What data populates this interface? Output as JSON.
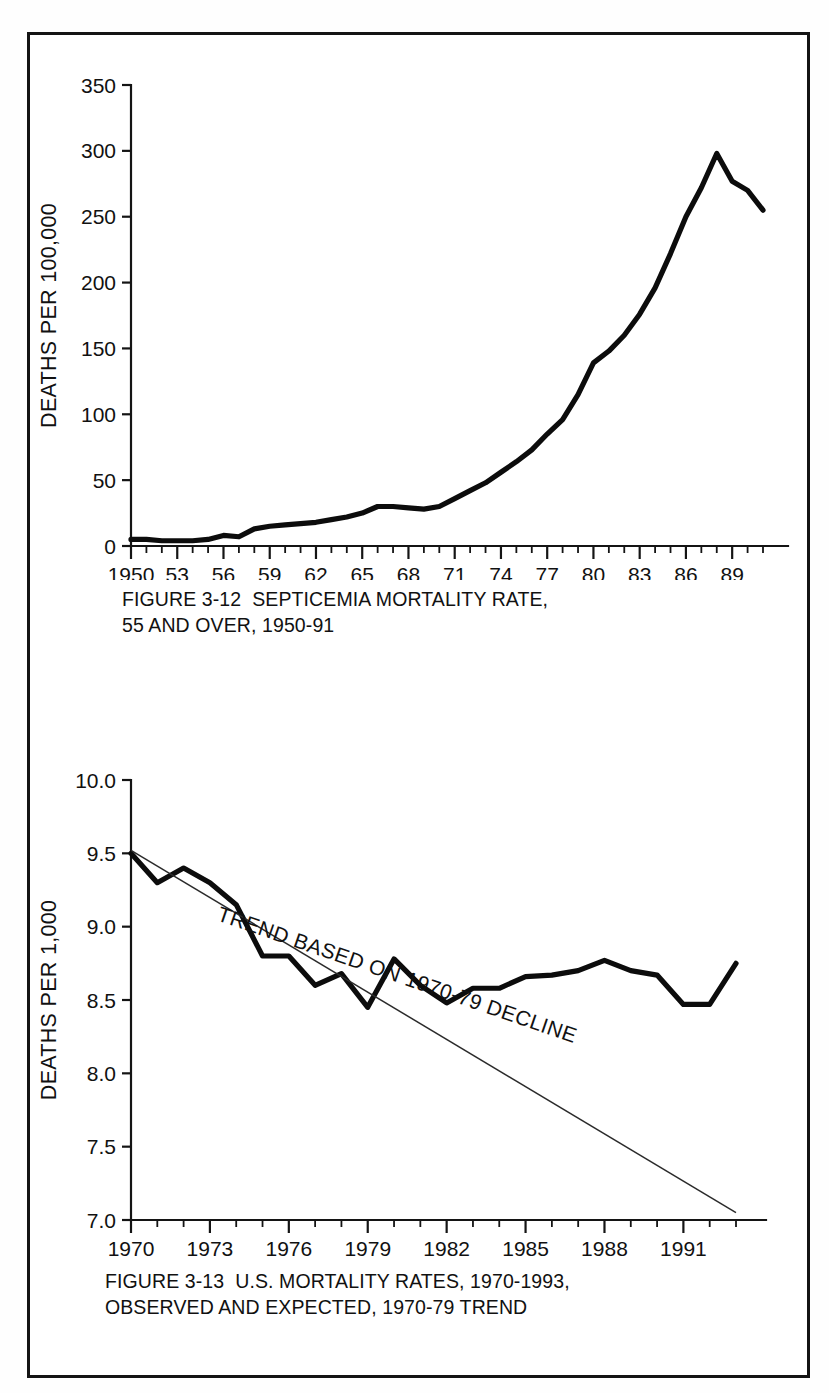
{
  "page": {
    "background": "#fefefe",
    "frame_color": "#141414"
  },
  "figures": [
    {
      "id": "figure-3-12",
      "caption_line_1": "FIGURE 3-12  SEPTICEMIA MORTALITY RATE,",
      "caption_line_2": "55 AND OVER, 1950-91",
      "ylabel": "DEATHS PER 100,000"
    },
    {
      "id": "figure-3-13",
      "caption_line_1": "FIGURE 3-13  U.S. MORTALITY RATES, 1970-1993,",
      "caption_line_2": "OBSERVED AND EXPECTED, 1970-79 TREND",
      "ylabel": "DEATHS PER 1,000",
      "annotation": "TREND BASED ON 1970-79 DECLINE"
    }
  ],
  "chart_data": [
    {
      "type": "line",
      "title": "FIGURE 3-12  SEPTICEMIA MORTALITY RATE, 55 AND OVER, 1950-91",
      "xlabel": "",
      "ylabel": "DEATHS PER 100,000",
      "xlim": [
        1950,
        1991
      ],
      "ylim": [
        0,
        350
      ],
      "yticks": [
        0,
        50,
        100,
        150,
        200,
        250,
        300,
        350
      ],
      "ytick_labels": [
        "0",
        "50",
        "100",
        "150",
        "200",
        "250",
        "300",
        "350"
      ],
      "xticks": [
        1950,
        1953,
        1956,
        1959,
        1962,
        1965,
        1968,
        1971,
        1974,
        1977,
        1980,
        1983,
        1986,
        1989
      ],
      "xtick_labels": [
        "1950",
        "53",
        "56",
        "59",
        "62",
        "65",
        "68",
        "71",
        "74",
        "77",
        "80",
        "83",
        "86",
        "89"
      ],
      "minor_xtick_interval": 1,
      "grid": false,
      "legend": null,
      "series": [
        {
          "name": "Septicemia mortality rate, 55 and over",
          "x": [
            1950,
            1951,
            1952,
            1953,
            1954,
            1955,
            1956,
            1957,
            1958,
            1959,
            1960,
            1961,
            1962,
            1963,
            1964,
            1965,
            1966,
            1967,
            1968,
            1969,
            1970,
            1971,
            1972,
            1973,
            1974,
            1975,
            1976,
            1977,
            1978,
            1979,
            1980,
            1981,
            1982,
            1983,
            1984,
            1985,
            1986,
            1987,
            1988,
            1989,
            1990,
            1991
          ],
          "values": [
            5,
            5,
            4,
            4,
            4,
            5,
            8,
            7,
            13,
            15,
            16,
            17,
            18,
            20,
            22,
            25,
            30,
            30,
            29,
            28,
            30,
            36,
            42,
            48,
            56,
            64,
            73,
            85,
            96,
            115,
            139,
            148,
            160,
            176,
            196,
            222,
            250,
            272,
            298,
            277,
            270,
            255
          ]
        }
      ]
    },
    {
      "type": "line",
      "title": "FIGURE 3-13  U.S. MORTALITY RATES, 1970-1993, OBSERVED AND EXPECTED, 1970-79 TREND",
      "xlabel": "",
      "ylabel": "DEATHS PER 1,000",
      "xlim": [
        1970,
        1993
      ],
      "ylim": [
        7.0,
        10.0
      ],
      "yticks": [
        7.0,
        7.5,
        8.0,
        8.5,
        9.0,
        9.5,
        10.0
      ],
      "ytick_labels": [
        "7.0",
        "7.5",
        "8.0",
        "8.5",
        "9.0",
        "9.5",
        "10.0"
      ],
      "xticks": [
        1970,
        1973,
        1976,
        1979,
        1982,
        1985,
        1988,
        1991
      ],
      "xtick_labels": [
        "1970",
        "1973",
        "1976",
        "1979",
        "1982",
        "1985",
        "1988",
        "1991"
      ],
      "minor_xtick_interval": 1,
      "grid": false,
      "annotations": [
        {
          "text": "TREND BASED ON 1970-79 DECLINE",
          "rotation": 19
        }
      ],
      "series": [
        {
          "name": "Observed",
          "x": [
            1970,
            1971,
            1972,
            1973,
            1974,
            1975,
            1976,
            1977,
            1978,
            1979,
            1980,
            1981,
            1982,
            1983,
            1984,
            1985,
            1986,
            1987,
            1988,
            1989,
            1990,
            1991,
            1992,
            1993
          ],
          "values": [
            9.5,
            9.3,
            9.4,
            9.3,
            9.15,
            8.8,
            8.8,
            8.6,
            8.68,
            8.45,
            8.78,
            8.6,
            8.48,
            8.58,
            8.58,
            8.66,
            8.67,
            8.7,
            8.77,
            8.7,
            8.67,
            8.47,
            8.47,
            8.75
          ]
        },
        {
          "name": "TREND BASED ON 1970-79 DECLINE",
          "x": [
            1970,
            1993
          ],
          "values": [
            9.52,
            7.05
          ]
        }
      ]
    }
  ]
}
